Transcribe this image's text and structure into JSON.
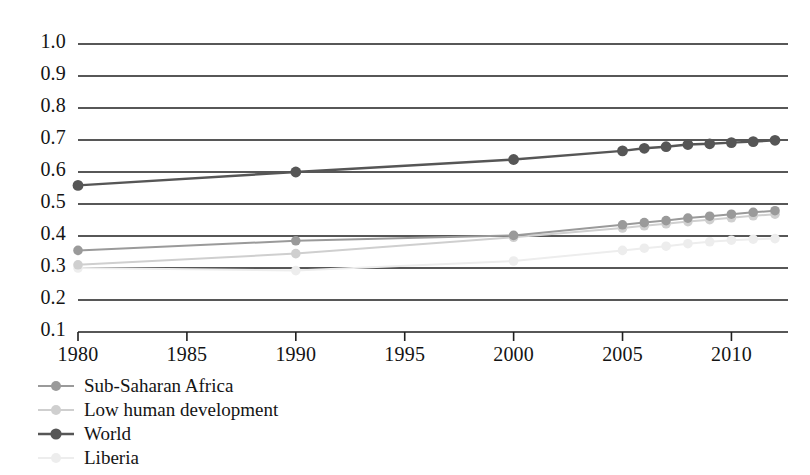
{
  "chart_data": {
    "type": "line",
    "title": "",
    "subtitle": "",
    "xlabel": "",
    "ylabel": "",
    "xlim": [
      1980,
      2012
    ],
    "ylim": [
      0.1,
      1.0
    ],
    "grid": true,
    "grid_axis": "y",
    "legend_position": "below-left",
    "x_ticks": [
      1980,
      1985,
      1990,
      1995,
      2000,
      2005,
      2010
    ],
    "x_tick_labels": [
      "1980",
      "1985",
      "1990",
      "1995",
      "2000",
      "2005",
      "2010"
    ],
    "y_ticks": [
      0.1,
      0.2,
      0.3,
      0.4,
      0.5,
      0.6,
      0.7,
      0.8,
      0.9,
      1.0
    ],
    "y_tick_labels": [
      "0.1",
      "0.2",
      "0.3",
      "0.4",
      "0.5",
      "0.6",
      "0.7",
      "0.8",
      "0.9",
      "1.0"
    ],
    "series": [
      {
        "name": "Sub-Saharan Africa",
        "color": "#9a9a9a",
        "marker": "circle",
        "x": [
          1980,
          1990,
          2000,
          2005,
          2006,
          2007,
          2008,
          2009,
          2010,
          2011,
          2012
        ],
        "values": [
          0.355,
          0.385,
          0.402,
          0.435,
          0.442,
          0.448,
          0.456,
          0.462,
          0.468,
          0.474,
          0.479
        ]
      },
      {
        "name": "Low human development",
        "color": "#cfcfcf",
        "marker": "circle",
        "x": [
          1980,
          1990,
          2000,
          2005,
          2006,
          2007,
          2008,
          2009,
          2010,
          2011,
          2012
        ],
        "values": [
          0.31,
          0.345,
          0.396,
          0.425,
          0.432,
          0.438,
          0.445,
          0.451,
          0.457,
          0.463,
          0.468
        ]
      },
      {
        "name": "World",
        "color": "#565656",
        "marker": "circle",
        "x": [
          1980,
          1990,
          2000,
          2005,
          2006,
          2007,
          2008,
          2009,
          2010,
          2011,
          2012
        ],
        "values": [
          0.558,
          0.6,
          0.639,
          0.666,
          0.674,
          0.679,
          0.686,
          0.688,
          0.692,
          0.695,
          0.699
        ]
      },
      {
        "name": "Liberia",
        "color": "#ededed",
        "marker": "circle",
        "x": [
          1980,
          1990,
          2000,
          2005,
          2006,
          2007,
          2008,
          2009,
          2010,
          2011,
          2012
        ],
        "values": [
          0.3,
          0.292,
          0.322,
          0.355,
          0.362,
          0.368,
          0.376,
          0.382,
          0.387,
          0.39,
          0.392
        ]
      }
    ]
  },
  "legend": {
    "items": [
      {
        "label": "Sub-Saharan Africa",
        "color": "#9a9a9a"
      },
      {
        "label": "Low human development",
        "color": "#cfcfcf"
      },
      {
        "label": "World",
        "color": "#565656"
      },
      {
        "label": "Liberia",
        "color": "#ededed"
      }
    ]
  },
  "axes": {
    "axis_color": "#1f1f1f",
    "grid_color": "#1f1f1f"
  }
}
